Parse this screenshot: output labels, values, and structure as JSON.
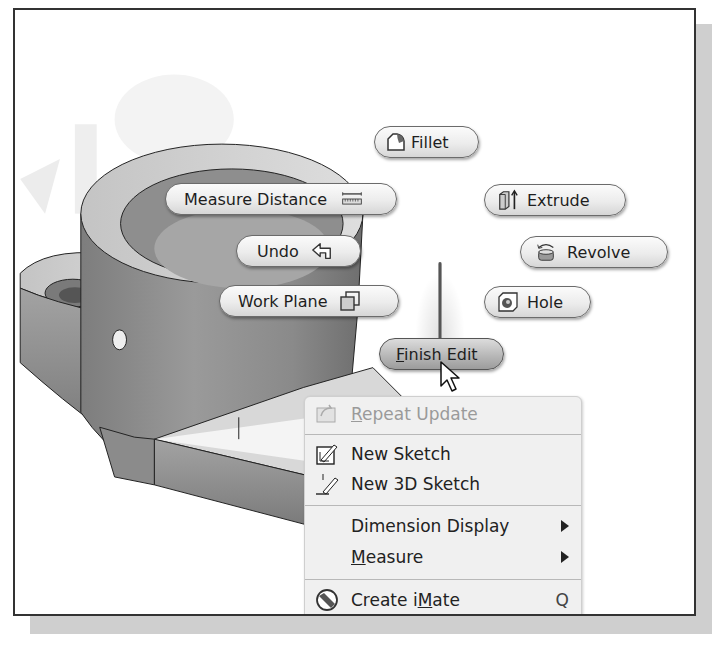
{
  "marking_menu": {
    "fillet": {
      "label": "Fillet",
      "icon": "fillet-icon"
    },
    "measure_distance": {
      "label": "Measure Distance",
      "icon": "measure-distance-icon"
    },
    "extrude": {
      "label": "Extrude",
      "icon": "extrude-icon"
    },
    "undo": {
      "label": "Undo",
      "icon": "undo-icon"
    },
    "revolve": {
      "label": "Revolve",
      "icon": "revolve-icon"
    },
    "work_plane": {
      "label": "Work Plane",
      "icon": "work-plane-icon"
    },
    "hole": {
      "label": "Hole",
      "icon": "hole-icon"
    },
    "finish_edit": {
      "label_mnemonic": "F",
      "label_rest": "inish Edit"
    }
  },
  "context_menu": {
    "items": [
      {
        "mnemonic": "R",
        "rest": "epeat Update",
        "icon": "repeat-update-icon",
        "disabled": true
      },
      {
        "label": "New Sketch",
        "icon": "new-sketch-icon"
      },
      {
        "label": "New 3D Sketch",
        "icon": "new-3d-sketch-icon"
      },
      {
        "label": "Dimension Display",
        "submenu": true
      },
      {
        "mnemonic": "M",
        "rest": "easure",
        "submenu": true
      },
      {
        "pre": "Create i",
        "mnemonic": "M",
        "rest": "ate",
        "icon": "create-imate-icon",
        "shortcut": "Q"
      }
    ]
  },
  "colors": {
    "frame_border": "#333333",
    "shadow": "#cfcfcf",
    "menu_bg": "#f0f0f0",
    "model_gray": "#8a8a8a"
  }
}
